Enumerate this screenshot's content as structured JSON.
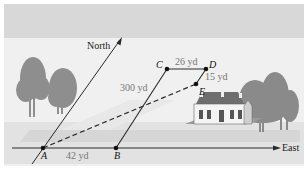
{
  "diagram": {
    "axes": {
      "north_label": "North",
      "east_label": "East"
    },
    "points": [
      {
        "id": "A",
        "label": "A"
      },
      {
        "id": "B",
        "label": "B"
      },
      {
        "id": "C",
        "label": "C"
      },
      {
        "id": "D",
        "label": "D"
      },
      {
        "id": "E",
        "label": "E"
      }
    ],
    "distances": {
      "AB": "42 yd",
      "BC": "300 yd",
      "CD": "26 yd",
      "DE": "15 yd"
    },
    "colors": {
      "sky_band": "#d9d9d9",
      "background": "#efefef",
      "ground_band": "#dcdcdc",
      "line": "#2a2a2a",
      "tree": "#8c8c8c",
      "house": "#7a7a7a",
      "label_gray": "#777777"
    }
  }
}
